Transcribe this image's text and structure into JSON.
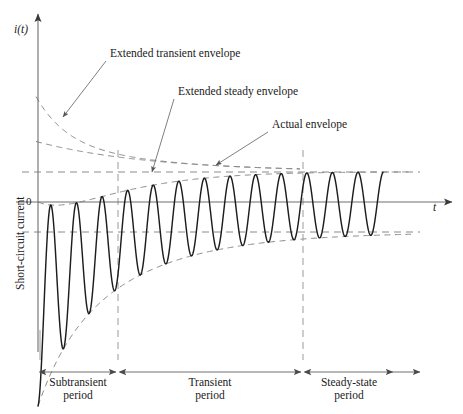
{
  "figure": {
    "title_axis_y": "i(t)",
    "title_axis_x": "t",
    "zero_label": "0",
    "ylabel": "Short-circuit current"
  },
  "annotations": [
    {
      "id": "extended-transient-envelope",
      "text": "Extended transient envelope",
      "text_x": 110,
      "text_y": 55,
      "leader_x1": 106,
      "leader_y1": 61,
      "leader_x2": 63,
      "leader_y2": 117
    },
    {
      "id": "extended-steady-envelope",
      "text": "Extended steady envelope",
      "text_x": 178,
      "text_y": 93,
      "leader_x1": 174,
      "leader_y1": 99,
      "leader_x2": 152,
      "leader_y2": 172
    },
    {
      "id": "actual-envelope",
      "text": "Actual envelope",
      "text_x": 272,
      "text_y": 126,
      "leader_x1": 268,
      "leader_y1": 132,
      "leader_x2": 216,
      "leader_y2": 165
    }
  ],
  "periods": [
    {
      "id": "subtransient",
      "line1": "Subtransient",
      "line2": "period",
      "x_start": 40,
      "x_end": 116,
      "center": 78
    },
    {
      "id": "transient",
      "line1": "Transient",
      "line2": "period",
      "x_start": 120,
      "x_end": 301,
      "center": 210
    },
    {
      "id": "steady-state",
      "line1": "Steady-state",
      "line2": "period",
      "x_start": 305,
      "x_end": 393,
      "center": 349
    }
  ],
  "dividers": [
    {
      "id": "subtransient-transient-divider",
      "x": 118,
      "y_top": 150,
      "y_bottom": 360
    },
    {
      "id": "transient-steady-divider",
      "x": 303,
      "y_top": 150,
      "y_bottom": 360
    }
  ],
  "chart_data": {
    "type": "line",
    "title": "",
    "xlabel": "t",
    "ylabel": "Short-circuit current",
    "axis": {
      "origin_x": 38,
      "zero_y": 202,
      "x_axis_end": 452,
      "y_axis_top": 14,
      "y_axis_bottom": 352
    },
    "waveform": {
      "description": "Asymmetric short-circuit current: AC component with decaying sub-transient and transient envelopes plus a decaying DC offset.",
      "x_start": 38,
      "x_end": 383,
      "period_px": 25.6,
      "phase_offset": 0.0,
      "ac_steady_amp": 30,
      "ac_transient_amp": 30,
      "ac_transient_tau": 115,
      "ac_subtransient_amp": 42,
      "ac_subtransient_tau": 30,
      "dc_offset_amp": 102,
      "dc_offset_tau": 82,
      "samples": 1400
    },
    "envelopes": {
      "steady_upper_y": 172,
      "steady_lower_y": 232,
      "actual_upper": "zero_y - dc - ac_envelope",
      "actual_lower": "zero_y - dc + ac_envelope",
      "extended_transient_upper_start_y": 62,
      "extended_transient_note": "dashed curve from upper-left decaying toward the steady upper level",
      "extended_steady_note": "dashed curve starting lower, decaying toward the steady upper level"
    },
    "gridlines": {
      "horizontal_dashed": [
        172,
        232
      ],
      "vertical_dashed": [
        118,
        303
      ]
    }
  },
  "colors": {
    "ink": "#1a1a1a",
    "waveform": "#1d1d1d",
    "axis": "#6e6e6e",
    "dashed": "#8a8a8a",
    "leader": "#707070"
  }
}
